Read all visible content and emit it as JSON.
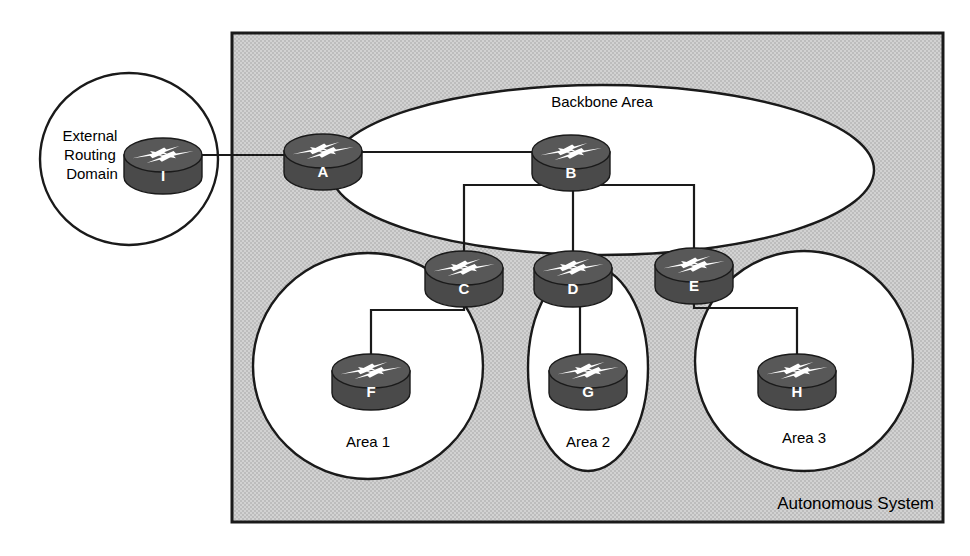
{
  "diagram": {
    "colors": {
      "as_fill": "#c9c9c9",
      "area_fill": "#ffffff",
      "router_body": "#4a4a4a",
      "router_top": "#585858",
      "router_arrow": "#ffffff",
      "stroke": "#1a1a1a",
      "text": "#000000",
      "page_background": "#ffffff"
    },
    "containers": [
      {
        "id": "external-routing-domain",
        "shape": "circle",
        "label": "External\nRouting\nDomain",
        "label_lines": [
          "External",
          "Routing",
          "Domain"
        ],
        "cx": 129,
        "cy": 159,
        "rx": 89,
        "ry": 86,
        "label_x": 92,
        "label_y": 141,
        "font_size": 15,
        "fill": "#ffffff"
      },
      {
        "id": "autonomous-system",
        "shape": "rect",
        "label": "Autonomous System",
        "x": 232,
        "y": 33,
        "width": 711,
        "height": 489,
        "label_x": 934,
        "label_y": 509,
        "font_size": 17,
        "fill": "#c9c9c9"
      },
      {
        "id": "backbone-area",
        "shape": "ellipse",
        "label": "Backbone Area",
        "cx": 602,
        "cy": 170,
        "rx": 272,
        "ry": 85,
        "label_x": 602,
        "label_y": 107,
        "font_size": 15,
        "fill": "#ffffff"
      },
      {
        "id": "area-1",
        "shape": "ellipse",
        "label": "Area 1",
        "cx": 368,
        "cy": 366,
        "rx": 115,
        "ry": 113,
        "label_x": 368,
        "label_y": 447,
        "font_size": 15,
        "fill": "#ffffff"
      },
      {
        "id": "area-2",
        "shape": "ellipse",
        "label": "Area 2",
        "cx": 588,
        "cy": 368,
        "rx": 60,
        "ry": 103,
        "label_x": 588,
        "label_y": 447,
        "font_size": 15,
        "fill": "#ffffff"
      },
      {
        "id": "area-3",
        "shape": "ellipse",
        "label": "Area 3",
        "cx": 804,
        "cy": 361,
        "rx": 109,
        "ry": 110,
        "label_x": 804,
        "label_y": 443,
        "font_size": 15,
        "fill": "#ffffff"
      }
    ],
    "routers": [
      {
        "id": "router-i",
        "label": "I",
        "cx": 163,
        "cy": 155,
        "rx": 39,
        "ry": 17,
        "height": 22
      },
      {
        "id": "router-a",
        "label": "A",
        "cx": 323,
        "cy": 151,
        "rx": 39,
        "ry": 17,
        "height": 22
      },
      {
        "id": "router-b",
        "label": "B",
        "cx": 571,
        "cy": 152,
        "rx": 39,
        "ry": 17,
        "height": 22
      },
      {
        "id": "router-c",
        "label": "C",
        "cx": 464,
        "cy": 268,
        "rx": 39,
        "ry": 17,
        "height": 22
      },
      {
        "id": "router-d",
        "label": "D",
        "cx": 573,
        "cy": 268,
        "rx": 39,
        "ry": 17,
        "height": 22
      },
      {
        "id": "router-e",
        "label": "E",
        "cx": 694,
        "cy": 265,
        "rx": 39,
        "ry": 17,
        "height": 22
      },
      {
        "id": "router-f",
        "label": "F",
        "cx": 371,
        "cy": 371,
        "rx": 39,
        "ry": 17,
        "height": 22
      },
      {
        "id": "router-g",
        "label": "G",
        "cx": 588,
        "cy": 371,
        "rx": 39,
        "ry": 17,
        "height": 22
      },
      {
        "id": "router-h",
        "label": "H",
        "cx": 797,
        "cy": 371,
        "rx": 39,
        "ry": 17,
        "height": 22
      }
    ],
    "links": [
      {
        "id": "link-i-a",
        "from": "I",
        "to": "A",
        "path": "M 202 155 L 284 155"
      },
      {
        "id": "link-a-b",
        "from": "A",
        "to": "B",
        "path": "M 362 152 L 532 152"
      },
      {
        "id": "link-b-c",
        "from": "B",
        "to": "C",
        "path": "M 556 174 L 556 185 L 464 185 L 464 253"
      },
      {
        "id": "link-b-d",
        "from": "B",
        "to": "D",
        "path": "M 573 174 L 573 253"
      },
      {
        "id": "link-b-e",
        "from": "B",
        "to": "E",
        "path": "M 588 174 L 588 185 L 694 185 L 694 250"
      },
      {
        "id": "link-c-f",
        "from": "C",
        "to": "F",
        "path": "M 464 285 L 464 310 L 371 310 L 371 358"
      },
      {
        "id": "link-d-g",
        "from": "D",
        "to": "G",
        "path": "M 580 285 L 580 358"
      },
      {
        "id": "link-e-h",
        "from": "E",
        "to": "H",
        "path": "M 694 282 L 694 308 L 797 308 L 797 358"
      }
    ]
  }
}
